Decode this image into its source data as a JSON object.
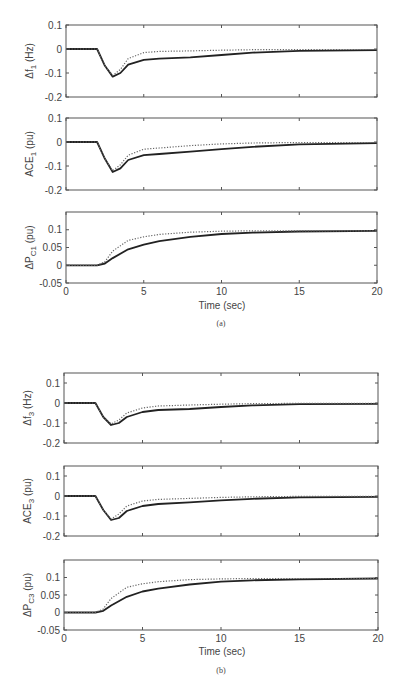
{
  "figures": [
    {
      "caption": "(a)",
      "xlabel": "Time (sec)"
    },
    {
      "caption": "(b)",
      "xlabel": "Time (sec)"
    }
  ],
  "chart_data": [
    {
      "type": "line",
      "figure": "(a)",
      "title": "",
      "ylabel": "Δf1 (Hz)",
      "ylabel_main": "Δf",
      "ylabel_sub": "1",
      "ylabel_unit": " (Hz)",
      "xlabel": "",
      "xlim": [
        0,
        20
      ],
      "ylim": [
        -0.2,
        0.1
      ],
      "xticks": [
        0,
        5,
        10,
        15,
        20
      ],
      "show_xticklabels": false,
      "yticks": [
        -0.2,
        -0.1,
        0,
        0.1
      ],
      "yticklabels": [
        "-0.2",
        "-0.1",
        "0",
        "0.1"
      ],
      "grid": false,
      "frame": {
        "x": 66,
        "y": 25,
        "w": 311,
        "h": 72
      },
      "series": [
        {
          "name": "solid",
          "style": "solid",
          "x": [
            0,
            2,
            2.5,
            3,
            3.5,
            4,
            5,
            6,
            8,
            10,
            12,
            15,
            20
          ],
          "y": [
            0,
            0,
            -0.07,
            -0.115,
            -0.1,
            -0.065,
            -0.045,
            -0.04,
            -0.035,
            -0.025,
            -0.015,
            -0.008,
            -0.005
          ]
        },
        {
          "name": "dotted",
          "style": "dotted",
          "x": [
            0,
            2,
            2.5,
            3,
            3.5,
            4,
            5,
            6,
            8,
            10,
            12,
            15,
            20
          ],
          "y": [
            0,
            0,
            -0.07,
            -0.11,
            -0.085,
            -0.04,
            -0.015,
            -0.01,
            -0.008,
            -0.005,
            -0.003,
            -0.002,
            -0.002
          ]
        }
      ]
    },
    {
      "type": "line",
      "figure": "(a)",
      "title": "",
      "ylabel": "ACE1 (pu)",
      "ylabel_main": "ACE",
      "ylabel_sub": "1",
      "ylabel_unit": " (pu)",
      "xlabel": "",
      "xlim": [
        0,
        20
      ],
      "ylim": [
        -0.2,
        0.1
      ],
      "xticks": [
        0,
        5,
        10,
        15,
        20
      ],
      "show_xticklabels": false,
      "yticks": [
        -0.2,
        -0.1,
        0,
        0.1
      ],
      "yticklabels": [
        "-0.2",
        "-0.1",
        "0",
        "0.1"
      ],
      "grid": false,
      "frame": {
        "x": 66,
        "y": 118,
        "w": 311,
        "h": 72
      },
      "series": [
        {
          "name": "solid",
          "style": "solid",
          "x": [
            0,
            2,
            2.5,
            3,
            3.5,
            4,
            5,
            6,
            8,
            10,
            12,
            15,
            20
          ],
          "y": [
            0,
            0,
            -0.07,
            -0.125,
            -0.11,
            -0.075,
            -0.055,
            -0.05,
            -0.04,
            -0.03,
            -0.02,
            -0.01,
            -0.005
          ]
        },
        {
          "name": "dotted",
          "style": "dotted",
          "x": [
            0,
            2,
            2.5,
            3,
            3.5,
            4,
            5,
            6,
            8,
            10,
            12,
            15,
            20
          ],
          "y": [
            0,
            0,
            -0.07,
            -0.12,
            -0.095,
            -0.055,
            -0.03,
            -0.025,
            -0.015,
            -0.008,
            -0.004,
            -0.002,
            -0.002
          ]
        }
      ]
    },
    {
      "type": "line",
      "figure": "(a)",
      "title": "",
      "ylabel": "ΔPC1 (pu)",
      "ylabel_main": "ΔP",
      "ylabel_sub": "C1",
      "ylabel_unit": " (pu)",
      "xlabel": "Time (sec)",
      "xlim": [
        0,
        20
      ],
      "ylim": [
        -0.05,
        0.15
      ],
      "xticks": [
        0,
        5,
        10,
        15,
        20
      ],
      "show_xticklabels": true,
      "yticks": [
        -0.05,
        0,
        0.05,
        0.1
      ],
      "yticklabels": [
        "-0.05",
        "0",
        "0.05",
        "0.1"
      ],
      "grid": false,
      "frame": {
        "x": 66,
        "y": 212,
        "w": 311,
        "h": 71
      },
      "series": [
        {
          "name": "solid",
          "style": "solid",
          "x": [
            0,
            2,
            2.5,
            3,
            4,
            5,
            6,
            8,
            10,
            12,
            15,
            20
          ],
          "y": [
            0,
            0,
            0.005,
            0.02,
            0.045,
            0.058,
            0.068,
            0.08,
            0.088,
            0.092,
            0.095,
            0.097
          ]
        },
        {
          "name": "dotted",
          "style": "dotted",
          "x": [
            0,
            2,
            2.5,
            3,
            4,
            5,
            6,
            8,
            10,
            12,
            15,
            20
          ],
          "y": [
            0,
            0,
            0.01,
            0.04,
            0.07,
            0.08,
            0.087,
            0.093,
            0.096,
            0.097,
            0.097,
            0.097
          ]
        }
      ]
    },
    {
      "type": "line",
      "figure": "(b)",
      "title": "",
      "ylabel": "Δf3 (Hz)",
      "ylabel_main": "Δf",
      "ylabel_sub": "3",
      "ylabel_unit": " (Hz)",
      "xlabel": "",
      "xlim": [
        0,
        20
      ],
      "ylim": [
        -0.2,
        0.15
      ],
      "xticks": [
        0,
        5,
        10,
        15,
        20
      ],
      "show_xticklabels": false,
      "yticks": [
        -0.2,
        -0.1,
        0,
        0.1
      ],
      "yticklabels": [
        "-0.2",
        "-0.1",
        "0",
        "0.1"
      ],
      "grid": false,
      "frame": {
        "x": 64,
        "y": 373,
        "w": 314,
        "h": 70
      },
      "series": [
        {
          "name": "solid",
          "style": "solid",
          "x": [
            0,
            2,
            2.5,
            3,
            3.5,
            4,
            5,
            6,
            8,
            10,
            12,
            15,
            20
          ],
          "y": [
            0,
            0,
            -0.07,
            -0.11,
            -0.1,
            -0.07,
            -0.045,
            -0.035,
            -0.03,
            -0.02,
            -0.012,
            -0.006,
            -0.004
          ]
        },
        {
          "name": "dotted",
          "style": "dotted",
          "x": [
            0,
            2,
            2.5,
            3,
            3.5,
            4,
            5,
            6,
            8,
            10,
            12,
            15,
            20
          ],
          "y": [
            0,
            0,
            -0.07,
            -0.105,
            -0.085,
            -0.05,
            -0.025,
            -0.015,
            -0.01,
            -0.006,
            -0.003,
            -0.002,
            -0.002
          ]
        }
      ]
    },
    {
      "type": "line",
      "figure": "(b)",
      "title": "",
      "ylabel": "ACE3 (pu)",
      "ylabel_main": "ACE",
      "ylabel_sub": "3",
      "ylabel_unit": " (pu)",
      "xlabel": "",
      "xlim": [
        0,
        20
      ],
      "ylim": [
        -0.2,
        0.15
      ],
      "xticks": [
        0,
        5,
        10,
        15,
        20
      ],
      "show_xticklabels": false,
      "yticks": [
        -0.2,
        -0.1,
        0,
        0.1
      ],
      "yticklabels": [
        "-0.2",
        "-0.1",
        "0",
        "0.1"
      ],
      "grid": false,
      "frame": {
        "x": 64,
        "y": 466,
        "w": 314,
        "h": 70
      },
      "series": [
        {
          "name": "solid",
          "style": "solid",
          "x": [
            0,
            2,
            2.5,
            3,
            3.5,
            4,
            5,
            6,
            8,
            10,
            12,
            15,
            20
          ],
          "y": [
            0,
            0,
            -0.07,
            -0.12,
            -0.11,
            -0.075,
            -0.05,
            -0.04,
            -0.032,
            -0.022,
            -0.014,
            -0.007,
            -0.004
          ]
        },
        {
          "name": "dotted",
          "style": "dotted",
          "x": [
            0,
            2,
            2.5,
            3,
            3.5,
            4,
            5,
            6,
            8,
            10,
            12,
            15,
            20
          ],
          "y": [
            0,
            0,
            -0.07,
            -0.115,
            -0.09,
            -0.05,
            -0.025,
            -0.017,
            -0.012,
            -0.007,
            -0.004,
            -0.002,
            -0.002
          ]
        }
      ]
    },
    {
      "type": "line",
      "figure": "(b)",
      "title": "",
      "ylabel": "ΔPC3 (pu)",
      "ylabel_main": "ΔP",
      "ylabel_sub": "C3",
      "ylabel_unit": " (pu)",
      "xlabel": "Time (sec)",
      "xlim": [
        0,
        20
      ],
      "ylim": [
        -0.05,
        0.15
      ],
      "xticks": [
        0,
        5,
        10,
        15,
        20
      ],
      "show_xticklabels": true,
      "yticks": [
        -0.05,
        0,
        0.05,
        0.1
      ],
      "yticklabels": [
        "-0.05",
        "0",
        "0.05",
        "0.1"
      ],
      "grid": false,
      "frame": {
        "x": 64,
        "y": 560,
        "w": 314,
        "h": 70
      },
      "series": [
        {
          "name": "solid",
          "style": "solid",
          "x": [
            0,
            2,
            2.5,
            3,
            4,
            5,
            6,
            8,
            10,
            12,
            15,
            20
          ],
          "y": [
            0,
            0,
            0.005,
            0.02,
            0.045,
            0.06,
            0.068,
            0.08,
            0.088,
            0.092,
            0.095,
            0.097
          ]
        },
        {
          "name": "dotted",
          "style": "dotted",
          "x": [
            0,
            2,
            2.5,
            3,
            4,
            5,
            6,
            8,
            10,
            12,
            15,
            20
          ],
          "y": [
            0,
            0,
            0.01,
            0.04,
            0.072,
            0.082,
            0.088,
            0.094,
            0.096,
            0.097,
            0.097,
            0.097
          ]
        }
      ]
    }
  ],
  "captions_layout": [
    {
      "caption_y": 323,
      "xlabel_y": 305
    },
    {
      "caption_y": 669,
      "xlabel_y": 651
    }
  ]
}
